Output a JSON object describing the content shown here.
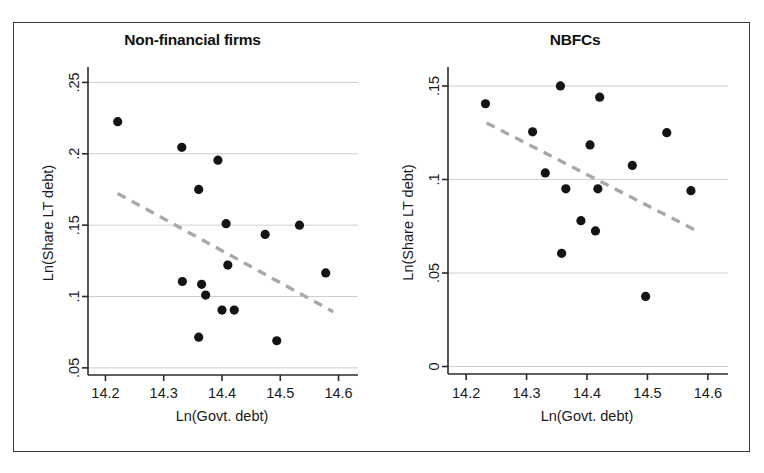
{
  "figure": {
    "panels": [
      {
        "id": "non-financial-firms",
        "title": "Non-financial firms"
      },
      {
        "id": "nbfcs",
        "title": "NBFCs"
      }
    ]
  },
  "chart_data": [
    {
      "type": "scatter",
      "title": "Non-financial firms",
      "xlabel": "Ln(Govt. debt)",
      "ylabel": "Ln(Share LT debt)",
      "xlim": [
        14.17,
        14.63
      ],
      "ylim": [
        0.045,
        0.258
      ],
      "xticks": [
        14.2,
        14.3,
        14.4,
        14.5,
        14.6
      ],
      "xtick_labels": [
        "14.2",
        "14.3",
        "14.4",
        "14.5",
        "14.6"
      ],
      "yticks": [
        0.05,
        0.1,
        0.15,
        0.2,
        0.25
      ],
      "ytick_labels": [
        ".05",
        ".1",
        ".15",
        ".2",
        ".25"
      ],
      "grid": "horizontal",
      "legend": "none",
      "points": [
        {
          "x": 14.221,
          "y": 0.2225
        },
        {
          "x": 14.331,
          "y": 0.2045
        },
        {
          "x": 14.36,
          "y": 0.175
        },
        {
          "x": 14.393,
          "y": 0.1955
        },
        {
          "x": 14.407,
          "y": 0.151
        },
        {
          "x": 14.533,
          "y": 0.15
        },
        {
          "x": 14.474,
          "y": 0.1435
        },
        {
          "x": 14.41,
          "y": 0.122
        },
        {
          "x": 14.578,
          "y": 0.1165
        },
        {
          "x": 14.332,
          "y": 0.1105
        },
        {
          "x": 14.365,
          "y": 0.1085
        },
        {
          "x": 14.372,
          "y": 0.101
        },
        {
          "x": 14.4,
          "y": 0.0905
        },
        {
          "x": 14.421,
          "y": 0.0905
        },
        {
          "x": 14.36,
          "y": 0.0715
        },
        {
          "x": 14.494,
          "y": 0.069
        }
      ],
      "fit_line": {
        "style": "dashed",
        "x0": 14.221,
        "y0": 0.1722,
        "x1": 14.591,
        "y1": 0.0893
      }
    },
    {
      "type": "scatter",
      "title": "NBFCs",
      "xlabel": "Ln(Govt. debt)",
      "ylabel": "Ln(Share LT debt)",
      "xlim": [
        14.17,
        14.63
      ],
      "ylim": [
        -0.004,
        0.158
      ],
      "xticks": [
        14.2,
        14.3,
        14.4,
        14.5,
        14.6
      ],
      "xtick_labels": [
        "14.2",
        "14.3",
        "14.4",
        "14.5",
        "14.6"
      ],
      "yticks": [
        0.0,
        0.05,
        0.1,
        0.15
      ],
      "ytick_labels": [
        "0",
        ".05",
        ".1",
        ".15"
      ],
      "grid": "horizontal",
      "legend": "none",
      "points": [
        {
          "x": 14.232,
          "y": 0.1405
        },
        {
          "x": 14.356,
          "y": 0.15
        },
        {
          "x": 14.421,
          "y": 0.144
        },
        {
          "x": 14.31,
          "y": 0.1255
        },
        {
          "x": 14.532,
          "y": 0.125
        },
        {
          "x": 14.405,
          "y": 0.1185
        },
        {
          "x": 14.475,
          "y": 0.1075
        },
        {
          "x": 14.331,
          "y": 0.1035
        },
        {
          "x": 14.365,
          "y": 0.095
        },
        {
          "x": 14.418,
          "y": 0.095
        },
        {
          "x": 14.572,
          "y": 0.094
        },
        {
          "x": 14.39,
          "y": 0.078
        },
        {
          "x": 14.414,
          "y": 0.0725
        },
        {
          "x": 14.358,
          "y": 0.0605
        },
        {
          "x": 14.497,
          "y": 0.0375
        }
      ],
      "fit_line": {
        "style": "dashed",
        "x0": 14.234,
        "y0": 0.1302,
        "x1": 14.583,
        "y1": 0.0723
      }
    }
  ]
}
